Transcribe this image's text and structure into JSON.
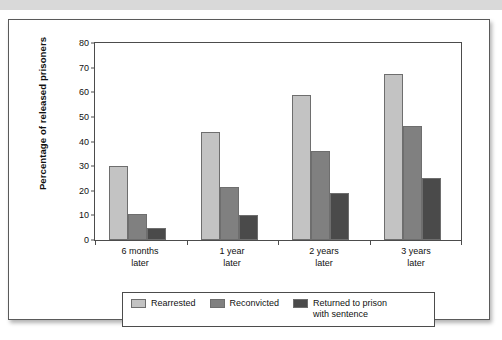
{
  "figure": {
    "top_band_color": "#d9d9d9",
    "frame_border_color": "#5a5a5a"
  },
  "chart_data": {
    "type": "bar",
    "title": "",
    "xlabel": "",
    "ylabel": "Percentage of released prisoners",
    "ylim": [
      0,
      80
    ],
    "ytick_step": 10,
    "yticks": [
      80,
      70,
      60,
      50,
      40,
      30,
      20,
      10,
      0
    ],
    "grid": false,
    "legend_position": "bottom",
    "categories": [
      "6 months\nlater",
      "1 year\nlater",
      "2 years\nlater",
      "3 years\nlater"
    ],
    "category_lines": [
      {
        "line1": "6 months",
        "line2": "later"
      },
      {
        "line1": "1 year",
        "line2": "later"
      },
      {
        "line1": "2 years",
        "line2": "later"
      },
      {
        "line1": "3 years",
        "line2": "later"
      }
    ],
    "series": [
      {
        "name": "Rearrested",
        "color": "#c3c3c3",
        "values": [
          30,
          44,
          59,
          67.5
        ]
      },
      {
        "name": "Reconvicted",
        "color": "#808080",
        "values": [
          10.5,
          21.5,
          36,
          46.5
        ]
      },
      {
        "name": "Returned to prison\nwith sentence",
        "color": "#4a4a4a",
        "values": [
          5,
          10.3,
          19,
          25
        ]
      }
    ]
  },
  "legend": {
    "items": [
      {
        "label": "Rearrested",
        "color": "#c3c3c3"
      },
      {
        "label": "Reconvicted",
        "color": "#808080"
      },
      {
        "label": "Returned to prison\nwith sentence",
        "color": "#4a4a4a"
      }
    ]
  }
}
